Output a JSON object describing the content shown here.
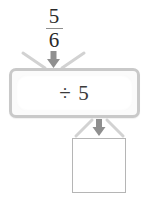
{
  "diagram": {
    "type": "function-machine",
    "input": {
      "kind": "fraction",
      "numerator": "5",
      "denominator": "6",
      "label": "5/6"
    },
    "machine": {
      "operation_label": "÷ 5",
      "operator_symbol": "÷",
      "operand": "5",
      "border_color": "#c9c9c9",
      "fill_color": "#fbfbfb"
    },
    "output": {
      "value": "",
      "placeholder": "",
      "is_blank": true,
      "border_color": "#b5b5b5"
    },
    "connectors": {
      "input_arrow": "down-arrow-icon",
      "output_arrow": "down-arrow-icon",
      "funnel_color": "#d0d0d0",
      "arrow_color": "#909090"
    }
  }
}
